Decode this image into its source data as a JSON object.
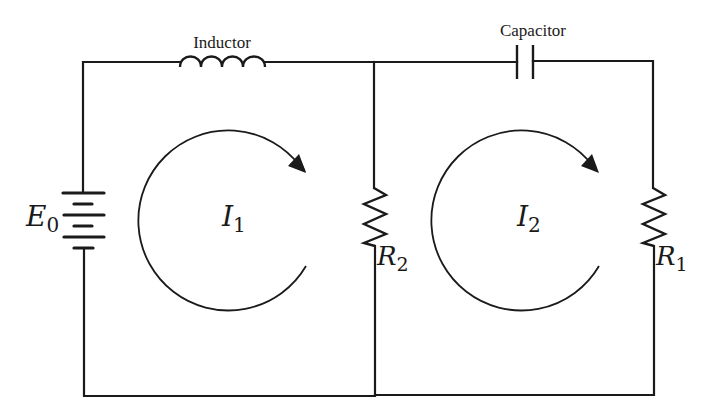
{
  "diagram": {
    "type": "circuit",
    "components": {
      "inductor": {
        "label": "Inductor"
      },
      "capacitor": {
        "label": "Capacitor"
      },
      "source": {
        "symbol": "E",
        "subscript": "0"
      },
      "resistor_middle": {
        "symbol": "R",
        "subscript": "2"
      },
      "resistor_right": {
        "symbol": "R",
        "subscript": "1"
      }
    },
    "loops": [
      {
        "symbol": "I",
        "subscript": "1",
        "direction": "clockwise"
      },
      {
        "symbol": "I",
        "subscript": "2",
        "direction": "clockwise"
      }
    ],
    "colors": {
      "ink": "#1a1a1a",
      "background": "#ffffff"
    }
  }
}
